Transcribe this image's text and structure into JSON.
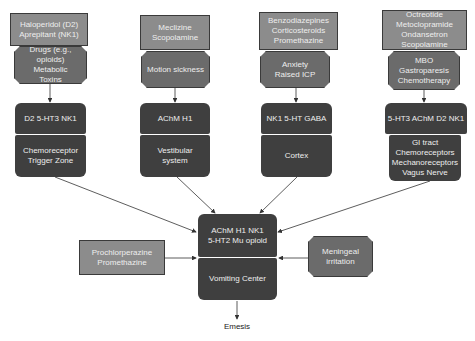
{
  "colors": {
    "drug_box": "#8c8c8c",
    "trigger_box": "#6b6b6b",
    "receptor_box": "#3f3f3f",
    "text_light": "#eeeeee",
    "arrow": "#333333"
  },
  "columns": [
    {
      "drugs": "Haloperidol (D2)\nAprepitant (NK1)",
      "triggers": "Drugs (e.g., opioids)\nMetabolic\nToxins",
      "receptors": "D2 5-HT3 NK1",
      "location": "Chemoreceptor\nTrigger Zone"
    },
    {
      "drugs": "Meclizine\nScopolamine",
      "triggers": "Motion sickness",
      "receptors": "AChM H1",
      "location": "Vestibular\nsystem"
    },
    {
      "drugs": "Benzodiazepines\nCorticosteroids\nPromethazine",
      "triggers": "Anxiety\nRaised ICP",
      "receptors": "NK1 5-HT GABA",
      "location": "Cortex"
    },
    {
      "drugs": "Octreotide\nMetoclopramide\nOndansetron\nScopolamine",
      "triggers": "MBO\nGastroparesis\nChemotherapy",
      "receptors": "5-HT3 AChM D2 NK1",
      "location": "GI tract\nChemoreceptors\nMechanoreceptors\nVagus Nerve"
    }
  ],
  "center": {
    "receptors": "AChM H1 NK1\n5-HT2 Mu opioid",
    "location": "Vomiting Center",
    "left_drugs": "Prochlorperazine\nPromethazine",
    "right_trigger": "Meningeal\nirritation",
    "outcome": "Emesis"
  }
}
